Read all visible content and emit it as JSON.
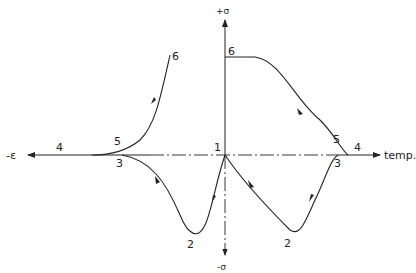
{
  "diagram": {
    "axes": {
      "y_positive_label": "+σ",
      "y_negative_label": "-σ",
      "x_negative_label": "-ε",
      "x_positive_label": "temp."
    },
    "point_labels": {
      "origin": "1",
      "left_min": "2",
      "right_min": "2",
      "left_3": "3",
      "right_3": "3",
      "left_4": "4",
      "right_4": "4",
      "left_5": "5",
      "right_5": "5",
      "left_6": "6",
      "right_6": "6"
    },
    "curves": [
      {
        "name": "left-cycle",
        "path": "1 → 2 → 3 → 4 → 5 → 6",
        "quadrants": "strain side"
      },
      {
        "name": "right-cycle",
        "path": "1 → 2 → 3 → 4 → 5 → 6",
        "quadrants": "temperature side"
      }
    ]
  }
}
